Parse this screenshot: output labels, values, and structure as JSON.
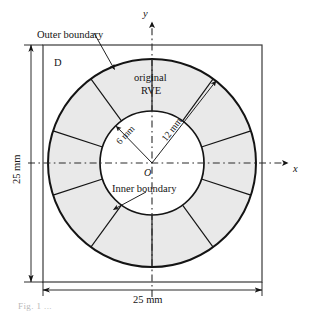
{
  "figure": {
    "domain_label": "D",
    "rve_label_line1": "original",
    "rve_label_line2": "RVE",
    "outer_boundary_label": "Outer boundary",
    "inner_boundary_label": "Inner boundary",
    "inner_radius_label": "6 mm",
    "outer_radius_label": "12 mm",
    "origin_label": "O",
    "axis_x_label": "x",
    "axis_y_label": "y",
    "width_dimension_label": "25 mm",
    "height_dimension_label": "25 mm",
    "caption": "Fig. 1 ..."
  },
  "colors": {
    "line": "#141414",
    "ring_fill": "#e9e9e9",
    "inner_fill": "#ffffff",
    "box_stroke": "#3a3a3a",
    "dash_axis": "#2b2b2b",
    "background": "#ffffff"
  },
  "geometry": {
    "center_x": 152,
    "center_y": 163,
    "outer_radius_px": 104,
    "inner_radius_px": 52,
    "segment_count": 10,
    "segment_start_angle_deg": 18,
    "box_left": 43,
    "box_top": 45,
    "box_right": 262,
    "box_bottom": 282
  }
}
